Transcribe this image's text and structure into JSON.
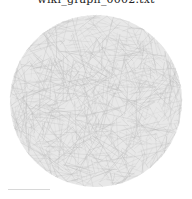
{
  "title": "wiki_graph_0002.txt",
  "diagram": {
    "type": "network-graph",
    "layout": "circular",
    "center": [
      96,
      101
    ],
    "radius": 86,
    "edge_color": "#b8b8b8",
    "fill_color": "#e6e6e6",
    "edge_count": 900
  }
}
